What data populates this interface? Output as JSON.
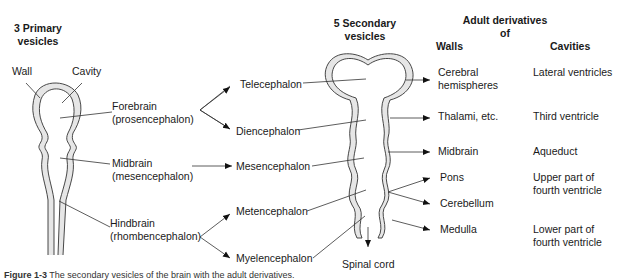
{
  "headers": {
    "primary": [
      "3 Primary",
      "vesicles"
    ],
    "secondary": [
      "5 Secondary",
      "vesicles"
    ],
    "adult": [
      "Adult derivatives",
      "of"
    ],
    "walls": "Walls",
    "cavities": "Cavities"
  },
  "primary_labels": {
    "wall": "Wall",
    "cavity": "Cavity",
    "forebrain": [
      "Forebrain",
      "(prosencephalon)"
    ],
    "midbrain": [
      "Midbrain",
      "(mesencephalon)"
    ],
    "hindbrain": [
      "Hindbrain",
      "(rhombencephalon)"
    ]
  },
  "secondary_labels": {
    "telencephalon": "Telecephalon",
    "diencephalon": "Diencephalon",
    "mesencephalon": "Mesencephalon",
    "metencephalon": "Metencephalon",
    "myelencephalon": "Myelencephalon",
    "spinal_cord": "Spinal cord"
  },
  "walls": {
    "cerebral": [
      "Cerebral",
      "hemispheres"
    ],
    "thalami": "Thalami, etc.",
    "midbrain": "Midbrain",
    "pons": "Pons",
    "cerebellum": "Cerebellum",
    "medulla": "Medulla"
  },
  "cavities": {
    "lateral": "Lateral ventricles",
    "third": "Third ventricle",
    "aqueduct": "Aqueduct",
    "upper_fourth": [
      "Upper part of",
      "fourth ventricle"
    ],
    "lower_fourth": [
      "Lower part of",
      "fourth ventricle"
    ]
  },
  "caption": {
    "figure": "Figure 1-3",
    "text": "The secondary vesicles of the brain with the adult derivatives."
  },
  "colors": {
    "tube_fill": "#e6e6e6",
    "stroke": "#333333",
    "text": "#1a1a1a"
  }
}
